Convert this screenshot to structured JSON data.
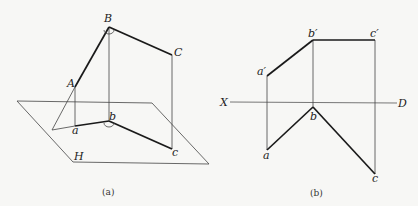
{
  "figure_a": {
    "caption": "(a)",
    "plane_label": "H",
    "points": {
      "A": {
        "label": "A"
      },
      "B": {
        "label": "B"
      },
      "C": {
        "label": "C"
      },
      "a": {
        "label": "a"
      },
      "b": {
        "label": "b"
      },
      "c": {
        "label": "c"
      }
    }
  },
  "figure_b": {
    "caption": "(b)",
    "axis_left_label": "X",
    "axis_right_label": "D",
    "points": {
      "a_prime": {
        "label": "a′"
      },
      "b_prime": {
        "label": "b′"
      },
      "c_prime": {
        "label": "c′"
      },
      "a": {
        "label": "a"
      },
      "b": {
        "label": "b"
      },
      "c": {
        "label": "c"
      }
    }
  },
  "colors": {
    "background": "#f7f7f5",
    "line": "#1a1a1a",
    "thin_line": "#444444"
  }
}
